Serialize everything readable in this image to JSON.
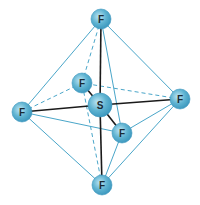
{
  "colors": {
    "atom_fill": "#5fb3d1",
    "atom_edge": "#3a96bd",
    "bond": "#1a1a1a",
    "edge": "#4aa6c9",
    "label": "#1a2a33"
  },
  "atoms": [
    {
      "id": "S",
      "label": "S",
      "x": 100,
      "y": 105,
      "r": 12
    },
    {
      "id": "F_top",
      "label": "F",
      "x": 101,
      "y": 19,
      "r": 10
    },
    {
      "id": "F_left",
      "label": "F",
      "x": 22,
      "y": 112,
      "r": 10
    },
    {
      "id": "F_right",
      "label": "F",
      "x": 180,
      "y": 99,
      "r": 10
    },
    {
      "id": "F_back",
      "label": "F",
      "x": 82,
      "y": 83,
      "r": 10
    },
    {
      "id": "F_front",
      "label": "F",
      "x": 122,
      "y": 133,
      "r": 10
    },
    {
      "id": "F_bottom",
      "label": "F",
      "x": 102,
      "y": 185,
      "r": 10
    }
  ],
  "bonds": [
    [
      "S",
      "F_top"
    ],
    [
      "S",
      "F_bottom"
    ],
    [
      "S",
      "F_left"
    ],
    [
      "S",
      "F_right"
    ],
    [
      "S",
      "F_back"
    ],
    [
      "S",
      "F_front"
    ]
  ],
  "edges_solid": [
    [
      "F_top",
      "F_left"
    ],
    [
      "F_top",
      "F_right"
    ],
    [
      "F_top",
      "F_front"
    ],
    [
      "F_bottom",
      "F_left"
    ],
    [
      "F_bottom",
      "F_right"
    ],
    [
      "F_bottom",
      "F_front"
    ],
    [
      "F_left",
      "F_front"
    ],
    [
      "F_right",
      "F_front"
    ]
  ],
  "edges_dashed": [
    [
      "F_top",
      "F_back"
    ],
    [
      "F_bottom",
      "F_back"
    ],
    [
      "F_left",
      "F_back"
    ],
    [
      "F_right",
      "F_back"
    ]
  ]
}
